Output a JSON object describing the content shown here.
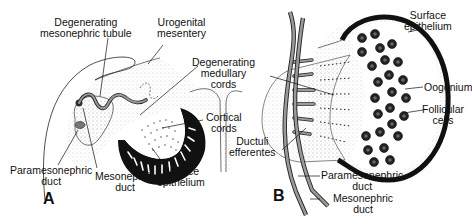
{
  "figure": {
    "panels": [
      {
        "id": "A",
        "letter": "A",
        "labels": {
          "degenerating_mesonephric_tubule": [
            "Degenerating",
            "mesonephric tubule"
          ],
          "urogenital_mesentery": [
            "Urogenital",
            "mesentery"
          ],
          "degenerating_medullary_cords": [
            "Degenerating",
            "medullary",
            "cords"
          ],
          "cortical_cords": [
            "Cortical",
            "cords"
          ],
          "paramesonephric_duct": [
            "Paramesonephric",
            "duct"
          ],
          "mesonephric_duct": [
            "Mesonephric",
            "duct"
          ],
          "surface_epithelium": [
            "Surface",
            "epithelium"
          ]
        }
      },
      {
        "id": "B",
        "letter": "B",
        "labels": {
          "surface_epithelium": [
            "Surface",
            "epithelium"
          ],
          "oogonium": [
            "Oogonium"
          ],
          "follicular_cells": [
            "Follicular",
            "cells"
          ],
          "ductuli_efferentes": [
            "Ductuli",
            "efferentes"
          ],
          "paramesonephric_duct": [
            "Paramesonephric",
            "duct"
          ],
          "mesonephric_duct": [
            "Mesonephric",
            "duct"
          ]
        }
      }
    ],
    "colors": {
      "ink": "#111111",
      "duct_gray": "#8a8a8a",
      "stipple": "#bdbdbd",
      "background": "#ffffff"
    }
  }
}
